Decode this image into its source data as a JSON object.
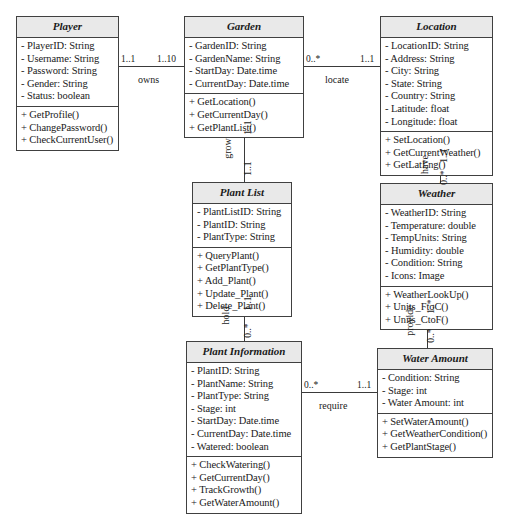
{
  "diagram": {
    "type": "uml-class-diagram",
    "classes": [
      {
        "id": "player",
        "name": "Player",
        "attributes": [
          "- PlayerID: String",
          "- Username: String",
          "- Password: String",
          "- Gender: String",
          "- Status: boolean"
        ],
        "operations": [
          "+ GetProfile()",
          "+ ChangePassword()",
          "+ CheckCurrentUser()"
        ]
      },
      {
        "id": "garden",
        "name": "Garden",
        "attributes": [
          "- GardenID: String",
          "- GardenName: String",
          "- StartDay: Date.time",
          "- CurrentDay: Date.time"
        ],
        "operations": [
          "+ GetLocation()",
          "+ GetCurrentDay()",
          "+ GetPlantList()"
        ]
      },
      {
        "id": "location",
        "name": "Location",
        "attributes": [
          "- LocationID: String",
          "- Address: String",
          "- City: String",
          "- State: String",
          "- Country: String",
          "- Latitude: float",
          "- Longitude: float"
        ],
        "operations": [
          "+ SetLocation()",
          "+ GetCurrentWeather()",
          "+ GetLatLng()"
        ]
      },
      {
        "id": "plantlist",
        "name": "Plant List",
        "attributes": [
          "- PlantListID: String",
          "- PlantID: String",
          "- PlantType: String"
        ],
        "operations": [
          "+ QueryPlant()",
          "+ GetPlantType()",
          "+ Add_Plant()",
          "+ Update_Plant()",
          "+ Delete_Plant()"
        ]
      },
      {
        "id": "weather",
        "name": "Weather",
        "attributes": [
          "- WeatherID: String",
          "- Temperature: double",
          "- TempUnits: String",
          "- Humidity: double",
          "- Condition: String",
          "- Icons: Image"
        ],
        "operations": [
          "+ WeatherLookUp()",
          "+ Units_FtoC()",
          "+ Units_CtoF()"
        ]
      },
      {
        "id": "plantinfo",
        "name": "Plant Information",
        "attributes": [
          "- PlantID: String",
          "- PlantName: String",
          "- PlantType: String",
          "- Stage: int",
          "- StartDay: Date.time",
          "- CurrentDay: Date.time",
          "- Watered: boolean"
        ],
        "operations": [
          "+ CheckWatering()",
          "+ GetCurrentDay()",
          "+ TrackGrowth()",
          "+ GetWaterAmount()"
        ]
      },
      {
        "id": "wateramount",
        "name": "Water Amount",
        "attributes": [
          "- Condition: String",
          "- Stage: int",
          "- Water Amount: int"
        ],
        "operations": [
          "+ SetWaterAmount()",
          "+ GetWeatherCondition()",
          "+ GetPlantStage()"
        ]
      }
    ],
    "associations": [
      {
        "id": "owns",
        "label": "owns",
        "source": "player",
        "target": "garden",
        "source_multiplicity": "1..1",
        "target_multiplicity": "1..10",
        "orientation": "horizontal"
      },
      {
        "id": "locate",
        "label": "locate",
        "source": "garden",
        "target": "location",
        "source_multiplicity": "0..*",
        "target_multiplicity": "1..1",
        "orientation": "horizontal"
      },
      {
        "id": "grow",
        "label": "grow",
        "source": "garden",
        "target": "plantlist",
        "source_multiplicity": "1..1",
        "target_multiplicity": "1..1",
        "orientation": "vertical"
      },
      {
        "id": "have",
        "label": "have",
        "source": "location",
        "target": "weather",
        "source_multiplicity": "1..1",
        "target_multiplicity": "0..*",
        "orientation": "vertical"
      },
      {
        "id": "hold",
        "label": "hold",
        "source": "plantlist",
        "target": "plantinfo",
        "source_multiplicity": "1..1",
        "target_multiplicity": "0..*",
        "orientation": "vertical"
      },
      {
        "id": "provide",
        "label": "provide",
        "source": "weather",
        "target": "wateramount",
        "source_multiplicity": "1..*",
        "target_multiplicity": "0..*",
        "orientation": "vertical"
      },
      {
        "id": "require",
        "label": "require",
        "source": "plantinfo",
        "target": "wateramount",
        "source_multiplicity": "0..*",
        "target_multiplicity": "1..1",
        "orientation": "horizontal"
      }
    ]
  }
}
